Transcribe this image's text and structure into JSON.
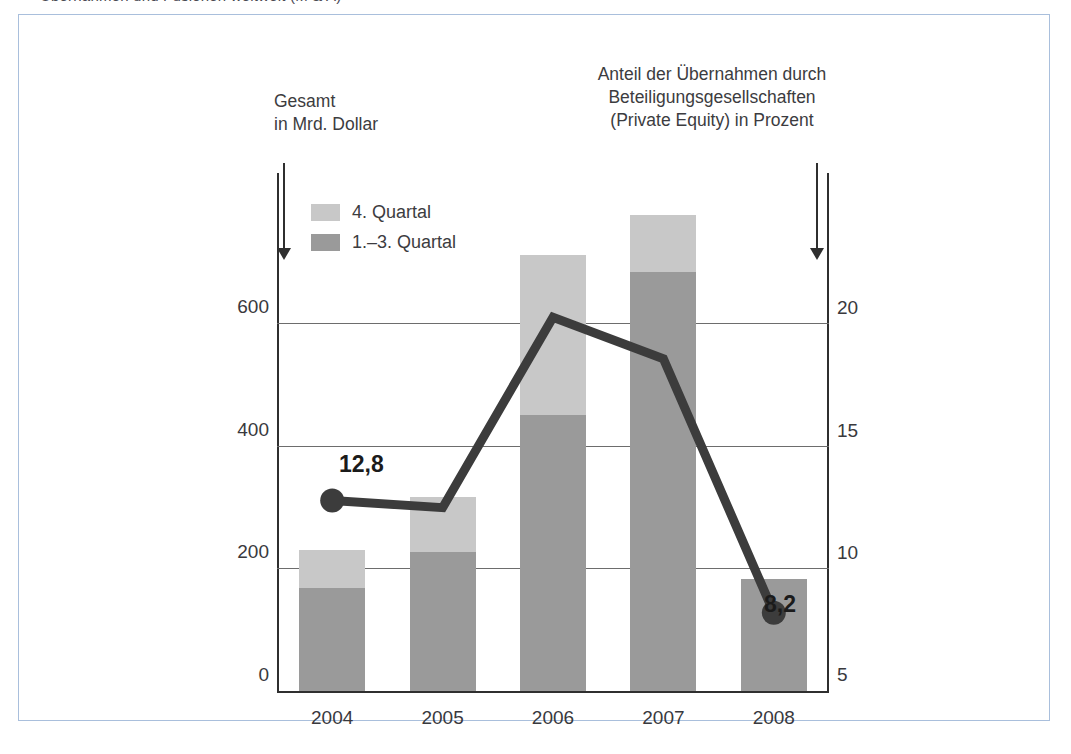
{
  "top_caption": "Übernahmen und Fusionen weltweit (M & A)",
  "annotations": {
    "left": {
      "line1": "Gesamt",
      "line2": "in Mrd. Dollar"
    },
    "right": {
      "line1": "Anteil der Übernahmen durch",
      "line2": "Beteiligungsgesellschaften",
      "line3": "(Private Equity) in Prozent"
    }
  },
  "legend": {
    "items": [
      {
        "label": "4. Quartal",
        "color": "#c8c8c8"
      },
      {
        "label": "1.–3.  Quartal",
        "color": "#9a9a9a"
      }
    ]
  },
  "value_labels": {
    "first": "12,8",
    "last": "8,2"
  },
  "chart_data": {
    "type": "bar",
    "title": "Übernahmen und Fusionen weltweit (M & A)",
    "categories": [
      "2004",
      "2005",
      "2006",
      "2007",
      "2008"
    ],
    "series": [
      {
        "name": "1.–3.  Quartal",
        "axis": "left",
        "type": "bar",
        "color": "#9a9a9a",
        "values": [
          168,
          226,
          450,
          683,
          182
        ]
      },
      {
        "name": "4. Quartal",
        "axis": "left",
        "type": "bar",
        "color": "#c8c8c8",
        "values": [
          62,
          91,
          262,
          94,
          0
        ]
      },
      {
        "name": "Anteil der Übernahmen durch Beteiligungsgesellschaften (Private Equity) in Prozent",
        "axis": "right",
        "type": "line",
        "color": "#3c3c3c",
        "values": [
          12.8,
          12.5,
          20.3,
          18.6,
          8.2
        ],
        "point_labels": [
          "12,8",
          null,
          null,
          null,
          "8,2"
        ],
        "markers_at": [
          "2004",
          "2008"
        ]
      }
    ],
    "stacked": true,
    "totals": [
      230,
      317,
      712,
      777,
      182
    ],
    "left_axis": {
      "label": "Gesamt in Mrd. Dollar",
      "ticks": [
        "0",
        "200",
        "400",
        "600"
      ],
      "tick_values": [
        0,
        200,
        400,
        600
      ],
      "range": [
        0,
        845
      ]
    },
    "right_axis": {
      "label": "Anteil der Übernahmen durch Beteiligungsgesellschaften (Private Equity) in Prozent",
      "ticks": [
        "5",
        "10",
        "15",
        "20"
      ],
      "tick_values": [
        5,
        10,
        15,
        20
      ],
      "range": [
        5,
        26.2
      ]
    },
    "xlabel": "",
    "grid": true,
    "legend_position": "top-left inside plot"
  }
}
